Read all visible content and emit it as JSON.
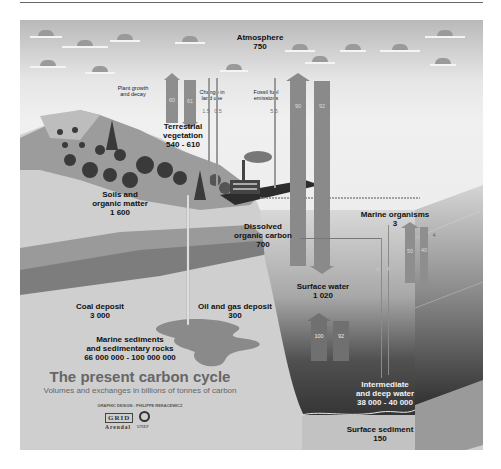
{
  "diagram": {
    "title": "The present carbon cycle",
    "subtitle": "Volumes and exchanges in billions of tonnes of carbon",
    "credit": "GRAPHIC DESIGN : PHILIPPE REKACEWICZ",
    "logos": {
      "grid": "GRID",
      "arendal": "Arendal",
      "unep": "UNEP"
    },
    "reservoirs": {
      "atmosphere": {
        "label": "Atmosphere",
        "value": "750"
      },
      "terrestrial_vegetation": {
        "label_1": "Terrestrial",
        "label_2": "vegetation",
        "value": "540 - 610"
      },
      "soils": {
        "label_1": "Soils and",
        "label_2": "organic matter",
        "value": "1 600"
      },
      "coal": {
        "label": "Coal deposit",
        "value": "3 000"
      },
      "oil_gas": {
        "label": "Oil and gas deposit",
        "value": "300"
      },
      "marine_sediments": {
        "label_1": "Marine sediments",
        "label_2": "and sedimentary rocks",
        "value": "66 000 000 - 100 000 000"
      },
      "dissolved_organic_carbon": {
        "label_1": "Dissolved",
        "label_2": "organic carbon",
        "value": "700"
      },
      "marine_organisms": {
        "label": "Marine organisms",
        "value": "3"
      },
      "surface_water": {
        "label": "Surface water",
        "value": "1 020"
      },
      "deep_water": {
        "label_1": "Intermediate",
        "label_2": "and deep water",
        "value": "38 000 - 40 000"
      },
      "surface_sediment": {
        "label": "Surface sediment",
        "value": "150"
      }
    },
    "flows": {
      "plant_growth": {
        "label_1": "Plant growth",
        "label_2": "and decay",
        "up": "60",
        "down": "61"
      },
      "land_use": {
        "label_1": "Change in",
        "label_2": "land use",
        "a": "1.5",
        "b": "0.5"
      },
      "fossil_fuel": {
        "label_1": "Fossil fuel",
        "label_2": "emissions",
        "value": "5.5"
      },
      "ocean_atmosphere": {
        "up": "90",
        "down": "92"
      },
      "surface_deep": {
        "up": "100",
        "down": "92"
      },
      "marine_bio": {
        "up": "50",
        "down": "40",
        "small": "4"
      },
      "doc_flow": {
        "a": "6",
        "b": "4"
      }
    }
  }
}
